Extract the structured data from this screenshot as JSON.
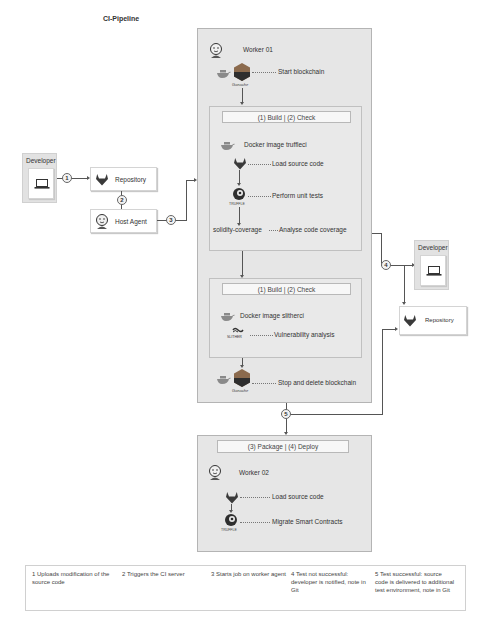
{
  "title": "CI-Pipeline",
  "developer_left": {
    "label": "Developer",
    "icon": "laptop-icon"
  },
  "repository_left": {
    "label": "Repository",
    "icon": "gitlab-icon"
  },
  "host_agent": {
    "label": "Host Agent",
    "icon": "jenkins-icon"
  },
  "worker01": {
    "label": "Worker 01",
    "start_blockchain": "Start blockchain",
    "ganache_label": "Ganache",
    "stage1": {
      "header": "(1) Build | (2) Check",
      "docker_image": "Docker image truffleci",
      "load_source": "Load source code",
      "unit_tests": "Perform unit tests",
      "truffle_label": "TRUFFLE",
      "coverage_tool": "solidity-coverage",
      "coverage_step": "Analyse code coverage"
    },
    "stage2": {
      "header": "(1) Build | (2) Check",
      "docker_image": "Docker image slitherci",
      "slither_label": "SLITHER",
      "vuln_analysis": "Vulnerability analysis"
    },
    "stop_blockchain": "Stop and delete blockchain"
  },
  "developer_right": {
    "label": "Developer",
    "icon": "laptop-icon"
  },
  "repository_right": {
    "label": "Repository",
    "icon": "gitlab-icon"
  },
  "worker02": {
    "header": "(3) Package | (4) Deploy",
    "label": "Worker 02",
    "load_source": "Load source code",
    "migrate": "Migrate Smart Contracts",
    "truffle_label": "TRUFFLE"
  },
  "steps": [
    "1",
    "2",
    "3",
    "4",
    "5"
  ],
  "legend": [
    "1 Uploads modification of the source code",
    "2 Triggers the CI server",
    "3 Starts job on worker agent",
    "4 Test not successful: developer is notified, note in Git",
    "5 Test successful: source code is delivered to additional test environment, note in Git"
  ],
  "colors": {
    "container": "#e6e6e6",
    "gitlab": "#3a3a3a",
    "docker": "#8a8a8a",
    "ganache": "#2e2e2e"
  }
}
